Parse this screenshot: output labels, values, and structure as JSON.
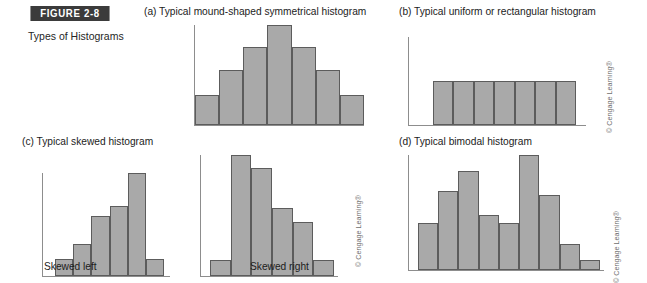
{
  "figure": {
    "banner_label": "FIGURE 2-8",
    "caption": "Types of Histograms",
    "banner_color": "#3b3b3b",
    "bar_fill_color": "#a9a9a9",
    "bar_border_color": "#5c5c5c",
    "axis_color": "#8d8d8d"
  },
  "copyright": {
    "text": "© Cengage Learning®"
  },
  "panels": {
    "a": {
      "title": "(a) Typical mound-shaped symmetrical histogram"
    },
    "b": {
      "title": "(b) Typical uniform or rectangular histogram"
    },
    "c": {
      "title": "(c) Typical skewed histogram",
      "left_label": "Skewed left",
      "right_label": "Skewed right"
    },
    "d": {
      "title": "(d) Typical bimodal histogram"
    }
  },
  "chart_data": [
    {
      "id": "mound-shaped-symmetrical",
      "type": "bar",
      "title": "(a) Typical mound-shaped symmetrical histogram",
      "xlabel": "",
      "ylabel": "",
      "grid": false,
      "legend": "none",
      "categories": [
        "1",
        "2",
        "3",
        "4",
        "5",
        "6",
        "7"
      ],
      "values": [
        30,
        55,
        78,
        100,
        78,
        55,
        30
      ],
      "ylim": [
        0,
        100
      ]
    },
    {
      "id": "uniform-rectangular",
      "type": "bar",
      "title": "(b) Typical uniform or rectangular histogram",
      "xlabel": "",
      "ylabel": "",
      "grid": false,
      "legend": "none",
      "categories": [
        "1",
        "2",
        "3",
        "4",
        "5",
        "6",
        "7"
      ],
      "values": [
        50,
        50,
        50,
        50,
        50,
        50,
        50
      ],
      "ylim": [
        0,
        100
      ]
    },
    {
      "id": "skewed-left",
      "type": "bar",
      "title": "Skewed left",
      "xlabel": "",
      "ylabel": "",
      "grid": false,
      "legend": "none",
      "categories": [
        "1",
        "2",
        "3",
        "4",
        "5",
        "6"
      ],
      "values": [
        17,
        31,
        58,
        68,
        100,
        17
      ],
      "ylim": [
        0,
        100
      ]
    },
    {
      "id": "skewed-right",
      "type": "bar",
      "title": "Skewed right",
      "xlabel": "",
      "ylabel": "",
      "grid": false,
      "legend": "none",
      "categories": [
        "1",
        "2",
        "3",
        "4",
        "5",
        "6"
      ],
      "values": [
        13,
        100,
        89,
        56,
        45,
        13
      ],
      "ylim": [
        0,
        100
      ]
    },
    {
      "id": "bimodal",
      "type": "bar",
      "title": "(d) Typical bimodal histogram",
      "xlabel": "",
      "ylabel": "",
      "grid": false,
      "legend": "none",
      "categories": [
        "1",
        "2",
        "3",
        "4",
        "5",
        "6",
        "7",
        "8",
        "9"
      ],
      "values": [
        41,
        69,
        86,
        48,
        41,
        100,
        65,
        23,
        9
      ],
      "ylim": [
        0,
        100
      ]
    }
  ]
}
